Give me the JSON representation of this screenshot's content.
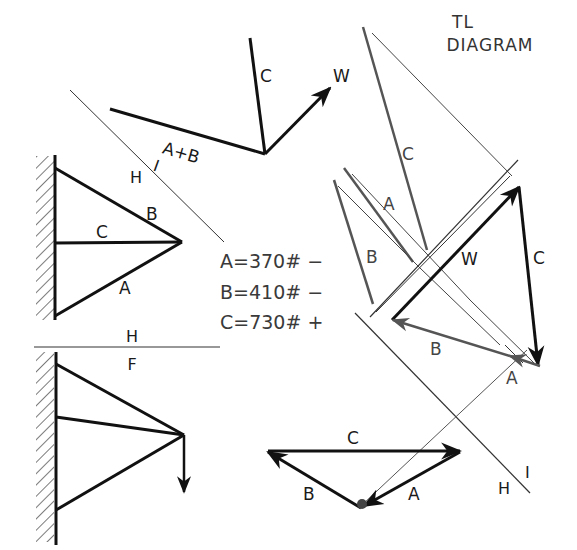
{
  "title": {
    "line1": "TL",
    "line2": "DIAGRAM"
  },
  "top_view": {
    "labels": {
      "c": "C",
      "w": "W",
      "ab": "A+B"
    }
  },
  "fold_line_top": {
    "h": "H",
    "i": "I"
  },
  "front_truss": {
    "labels": {
      "a": "A",
      "b": "B",
      "c": "C"
    }
  },
  "fold_line_hf": {
    "h": "H",
    "f": "F"
  },
  "results": [
    {
      "member": "A",
      "value": "370",
      "unit": "#",
      "sign": "−",
      "text": "A=370# −"
    },
    {
      "member": "B",
      "value": "410",
      "unit": "#",
      "sign": "−",
      "text": "B=410# −"
    },
    {
      "member": "C",
      "value": "730",
      "unit": "#",
      "sign": "+",
      "text": "C=730# +"
    }
  ],
  "tl_diagram": {
    "labels": {
      "c_upper": "C",
      "a_upper": "A",
      "b_upper": "B",
      "w": "W",
      "c_right": "C",
      "b_lower": "B",
      "a_lower": "A"
    }
  },
  "force_polygon": {
    "labels": {
      "c": "C",
      "b": "B",
      "a": "A"
    }
  },
  "fold_line_bottom": {
    "h": "H",
    "i": "I"
  },
  "colors": {
    "ink": "#111111",
    "gray_ink": "#555555",
    "thin_line": "#333333"
  }
}
